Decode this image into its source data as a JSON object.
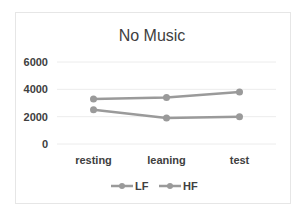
{
  "chart_data": {
    "type": "line",
    "title": "No Music",
    "xlabel": "",
    "ylabel": "",
    "categories": [
      "resting",
      "leaning",
      "test"
    ],
    "ylim": [
      0,
      6000
    ],
    "yticks": [
      "0",
      "2000",
      "4000",
      "6000"
    ],
    "ytick_values": [
      0,
      2000,
      4000,
      6000
    ],
    "grid": true,
    "legend_position": "bottom",
    "series": [
      {
        "name": "LF",
        "values": [
          3300,
          3400,
          3800
        ],
        "color": "#9a9a9a"
      },
      {
        "name": "HF",
        "values": [
          2500,
          1900,
          2000
        ],
        "color": "#9a9a9a"
      }
    ]
  }
}
